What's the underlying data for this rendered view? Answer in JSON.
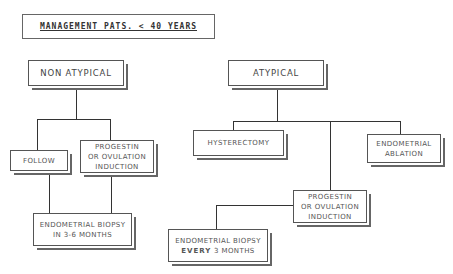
{
  "title": "MANAGEMENT PATS. < 40 YEARS",
  "branches": {
    "non_atypical": {
      "label": "NON ATYPICAL",
      "children": {
        "follow": "FOLLOW",
        "progestin": {
          "line1": "PROGESTIN",
          "line2": "OR OVULATION",
          "line3": "INDUCTION"
        }
      },
      "biopsy": {
        "line1": "ENDOMETRIAL BIOPSY",
        "line2": "IN 3-6 MONTHS"
      }
    },
    "atypical": {
      "label": "ATYPICAL",
      "children": {
        "hysterectomy": "HYSTERECTOMY",
        "ablation": {
          "line1": "ENDOMETRIAL",
          "line2": "ABLATION"
        },
        "progestin": {
          "line1": "PROGESTIN",
          "line2": "OR OVULATION",
          "line3": "INDUCTION"
        }
      },
      "biopsy": {
        "line1": "ENDOMETRIAL BIOPSY",
        "line2_bold": "EVERY",
        "line2_rest": " 3 MONTHS"
      }
    }
  }
}
